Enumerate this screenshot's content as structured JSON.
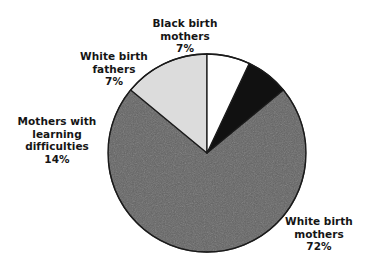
{
  "background_color": "#ffffff",
  "chart_data": {
    "type": "pie",
    "title": "",
    "subtitle": "",
    "xlabel": "",
    "ylabel": "",
    "legend_position": "none",
    "grid": false,
    "labels_outside": true,
    "start_angle_deg": 0,
    "direction": "clockwise",
    "categories": [
      "White birth mothers",
      "Mothers with learning difficulties",
      "White birth fathers",
      "Black birth mothers"
    ],
    "values": [
      72,
      14,
      7,
      7
    ],
    "value_unit": "%",
    "colors": [
      "#636363",
      "#dcdcdc",
      "#111111",
      "#ffffff"
    ],
    "slices": [
      {
        "name": "white-birth-mothers",
        "label_line1": "White birth",
        "label_line2": "mothers",
        "value": 72,
        "value_text": "72%",
        "color": "#636363",
        "outline": "#1a1a1a",
        "start_pct": 14,
        "end_pct": 86
      },
      {
        "name": "mothers-with-learning-difficulties",
        "label_line1": "Mothers with",
        "label_line2": "learning",
        "label_line3": "difficulties",
        "value": 14,
        "value_text": "14%",
        "color": "#dcdcdc",
        "outline": "#1a1a1a",
        "start_pct": 86,
        "end_pct": 100
      },
      {
        "name": "white-birth-fathers",
        "label_line1": "White birth",
        "label_line2": "fathers",
        "value": 7,
        "value_text": "7%",
        "color": "#111111",
        "outline": "#1a1a1a",
        "start_pct": 7,
        "end_pct": 14
      },
      {
        "name": "black-birth-mothers",
        "label_line1": "Black birth",
        "label_line2": "mothers",
        "value": 7,
        "value_text": "7%",
        "color": "#ffffff",
        "outline": "#1a1a1a",
        "start_pct": 0,
        "end_pct": 7
      }
    ]
  },
  "labels": {
    "black_birth_mothers": {
      "text": "Black birth\nmothers",
      "percent": "7%"
    },
    "white_birth_fathers": {
      "text": "White birth\nfathers",
      "percent": "7%"
    },
    "mothers_learning_difficulties": {
      "text": "Mothers with\nlearning\ndifficulties",
      "percent": "14%"
    },
    "white_birth_mothers": {
      "text": "White birth\nmothers",
      "percent": "72%"
    }
  }
}
